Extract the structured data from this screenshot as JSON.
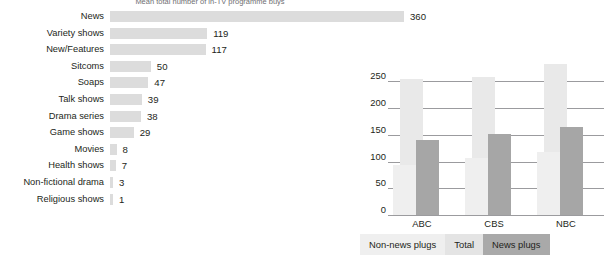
{
  "title": "Mean total number of in-TV programme buys",
  "chart_data": [
    {
      "type": "bar",
      "orientation": "horizontal",
      "title": "Mean total number of in-TV programme buys",
      "xlabel": "",
      "ylabel": "",
      "categories": [
        "News",
        "Variety shows",
        "New/Features",
        "Sitcoms",
        "Soaps",
        "Talk shows",
        "Drama series",
        "Game shows",
        "Movies",
        "Health shows",
        "Non-fictional drama",
        "Religious shows"
      ],
      "values": [
        360,
        119,
        117,
        50,
        47,
        39,
        38,
        29,
        8,
        7,
        3,
        1
      ],
      "value_labels": [
        "360",
        "119",
        "117",
        "50",
        "47",
        "39",
        "38",
        "29",
        "8",
        "7",
        "3",
        "1"
      ],
      "xlim": [
        0,
        360
      ],
      "grid": false,
      "bar_color": "#dcdcdc"
    },
    {
      "type": "bar",
      "orientation": "vertical",
      "title": "",
      "xlabel": "",
      "ylabel": "",
      "categories": [
        "ABC",
        "CBS",
        "NBC"
      ],
      "series": [
        {
          "name": "Non-news plugs",
          "values": [
            94,
            107,
            118
          ],
          "color": "#efefef"
        },
        {
          "name": "Total",
          "values": [
            255,
            258,
            283
          ],
          "color": "#e9e9e9"
        },
        {
          "name": "News plugs",
          "values": [
            140,
            152,
            165
          ],
          "color": "#a6a6a6"
        }
      ],
      "yticks": [
        0,
        50,
        100,
        150,
        200,
        250
      ],
      "ytick_labels": [
        "0",
        "50",
        "100",
        "150",
        "200",
        "250"
      ],
      "ylim": [
        0,
        290
      ],
      "grid": true,
      "legend_position": "bottom"
    }
  ],
  "left_chart": {
    "rows": [
      {
        "label": "News",
        "value": "360",
        "pct": 100.0
      },
      {
        "label": "Variety shows",
        "value": "119",
        "pct": 33.05
      },
      {
        "label": "New/Features",
        "value": "117",
        "pct": 32.5
      },
      {
        "label": "Sitcoms",
        "value": "50",
        "pct": 13.9
      },
      {
        "label": "Soaps",
        "value": "47",
        "pct": 13.05
      },
      {
        "label": "Talk shows",
        "value": "39",
        "pct": 10.83
      },
      {
        "label": "Drama series",
        "value": "38",
        "pct": 10.55
      },
      {
        "label": "Game shows",
        "value": "29",
        "pct": 8.05
      },
      {
        "label": "Movies",
        "value": "8",
        "pct": 2.22
      },
      {
        "label": "Health shows",
        "value": "7",
        "pct": 1.94
      },
      {
        "label": "Non-fictional drama",
        "value": "3",
        "pct": 0.83
      },
      {
        "label": "Religious shows",
        "value": "1",
        "pct": 0.28
      }
    ]
  },
  "right_chart": {
    "yticks": [
      "250",
      "200",
      "150",
      "100",
      "50",
      "0"
    ],
    "xticks": [
      "ABC",
      "CBS",
      "NBC"
    ],
    "groups": [
      {
        "name": "ABC",
        "nonnews": 94,
        "total": 255,
        "news": 140
      },
      {
        "name": "CBS",
        "nonnews": 107,
        "total": 258,
        "news": 152
      },
      {
        "name": "NBC",
        "nonnews": 118,
        "total": 283,
        "news": 165
      }
    ]
  },
  "legend": {
    "items": [
      {
        "label": "Non-news plugs",
        "color": "#efefef"
      },
      {
        "label": "Total",
        "color": "#e4e4e4"
      },
      {
        "label": "News plugs",
        "color": "#a9a9a9"
      }
    ]
  },
  "colors": {
    "h_bar": "#dcdcdc",
    "total": "#e9e9e9",
    "nonnews": "#efefef",
    "news": "#a6a6a6",
    "grid": "#9b9b9e",
    "text": "#231f20"
  }
}
